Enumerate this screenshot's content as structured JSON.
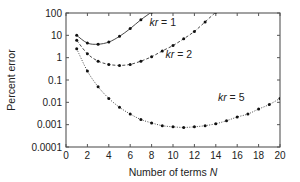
{
  "chart_data": {
    "type": "line",
    "title": "",
    "xlabel": "Number of terms N",
    "xlabel_text": "Number of terms ",
    "xlabel_var": "N",
    "ylabel": "Percent error",
    "xlim": [
      0,
      20
    ],
    "ylim": [
      0.0001,
      100
    ],
    "yscale": "log",
    "grid": false,
    "x_ticks": [
      0,
      2,
      4,
      6,
      8,
      10,
      12,
      14,
      16,
      18,
      20
    ],
    "x_tick_labels": [
      "0",
      "2",
      "4",
      "6",
      "8",
      "10",
      "12",
      "14",
      "16",
      "18",
      "20"
    ],
    "y_ticks": [
      0.0001,
      0.001,
      0.01,
      0.1,
      1,
      10,
      100
    ],
    "y_tick_labels": [
      "0.0001",
      "0.001",
      "0.01",
      "0.1",
      "1",
      "10",
      "100"
    ],
    "series": [
      {
        "name": "kr = 1",
        "label_var": "kr",
        "label_value": " = 1",
        "style": "solid",
        "x": [
          1,
          2,
          3,
          4,
          5,
          6,
          7,
          8
        ],
        "values": [
          10,
          4.5,
          4,
          5,
          9,
          20,
          50,
          110
        ]
      },
      {
        "name": "kr = 2",
        "label_var": "kr",
        "label_value": " = 2",
        "style": "dashed",
        "x": [
          1,
          2,
          3,
          4,
          5,
          6,
          7,
          8,
          9,
          10,
          11,
          12,
          13,
          14
        ],
        "values": [
          6,
          1.5,
          0.7,
          0.5,
          0.45,
          0.5,
          0.7,
          1.1,
          2,
          3.5,
          7,
          15,
          40,
          110
        ]
      },
      {
        "name": "kr = 5",
        "label_var": "kr",
        "label_value": " = 5",
        "style": "dotted",
        "x": [
          1,
          2,
          3,
          4,
          5,
          6,
          7,
          8,
          9,
          10,
          11,
          12,
          13,
          14,
          15,
          16,
          17,
          18,
          19,
          20
        ],
        "values": [
          2.5,
          0.25,
          0.05,
          0.015,
          0.006,
          0.003,
          0.0017,
          0.0012,
          0.0009,
          0.0008,
          0.00075,
          0.0008,
          0.0009,
          0.0011,
          0.0015,
          0.0022,
          0.003,
          0.005,
          0.008,
          0.015
        ]
      }
    ],
    "annotations": [
      {
        "series": 0,
        "text": "kr = 1",
        "x": 7.8,
        "y": 25
      },
      {
        "series": 1,
        "text": "kr = 2",
        "x": 9.3,
        "y": 1.0
      },
      {
        "series": 2,
        "text": "kr = 5",
        "x": 14.2,
        "y": 0.012
      }
    ],
    "colors": {
      "line": "#333333",
      "marker": "#111111",
      "axis": "#555555"
    }
  }
}
